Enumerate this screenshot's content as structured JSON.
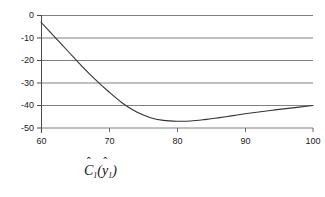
{
  "figure": {
    "caption": {
      "full_text": "Ĉ₁(ŷ₁)",
      "base_symbol": "C",
      "base_subscript": "1",
      "open_paren": "(",
      "inner_symbol": "y",
      "inner_subscript": "1",
      "close_paren": ")",
      "hat_glyph": "ˆ"
    }
  },
  "chart_data": {
    "type": "line",
    "title": "",
    "xlabel": "",
    "ylabel": "",
    "xlim": [
      60,
      100
    ],
    "ylim": [
      -50,
      0
    ],
    "grid": true,
    "grid_orientation": "horizontal",
    "legend": "none",
    "xticks": [
      60,
      70,
      80,
      90,
      100
    ],
    "xtick_labels": [
      "60",
      "70",
      "80",
      "90",
      "100"
    ],
    "yticks": [
      0,
      -10,
      -20,
      -30,
      -40,
      -50
    ],
    "ytick_labels": [
      "0",
      "-10",
      "-20",
      "-30",
      "-40",
      "-50"
    ],
    "colors": {
      "curve": "#333333",
      "gridline": "#808080",
      "axis": "#555555",
      "background": "#ffffff",
      "text": "#1a1a1a"
    },
    "series": [
      {
        "name": "C1(y1)",
        "x": [
          60,
          62,
          64,
          66,
          68,
          70,
          72,
          74,
          76,
          78,
          80,
          82,
          84,
          86,
          88,
          90,
          92,
          94,
          96,
          98,
          100
        ],
        "values": [
          -3.0,
          -9.5,
          -16.0,
          -22.5,
          -28.5,
          -34.0,
          -39.0,
          -42.8,
          -45.3,
          -46.6,
          -47.0,
          -46.9,
          -46.3,
          -45.5,
          -44.6,
          -43.7,
          -42.9,
          -42.1,
          -41.4,
          -40.7,
          -40.0
        ]
      }
    ],
    "annotations": {
      "minimum_x": 81,
      "minimum_y": -47.0,
      "start_point": [
        60,
        -3.0
      ],
      "end_point": [
        100,
        -40.0
      ]
    }
  }
}
